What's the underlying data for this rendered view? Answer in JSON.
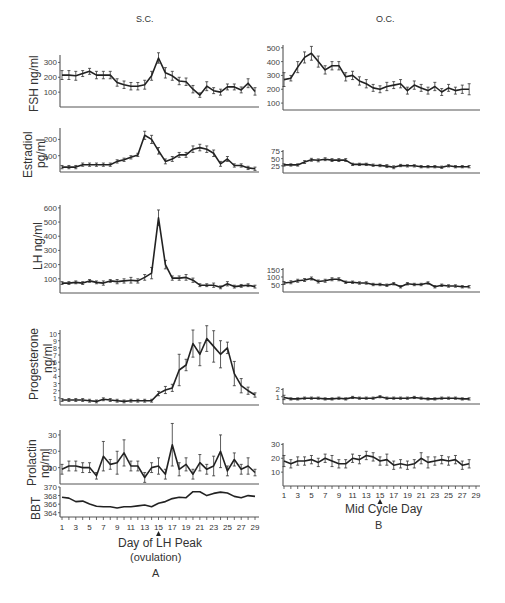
{
  "chart_data": [
    {
      "panel": "A",
      "title": "S.C.",
      "type": "line",
      "xlabel": "Day of LH Peak (ovulation)",
      "x": [
        1,
        2,
        3,
        4,
        5,
        6,
        7,
        8,
        9,
        10,
        11,
        12,
        13,
        14,
        15,
        16,
        17,
        18,
        19,
        20,
        21,
        22,
        23,
        24,
        25,
        26,
        27,
        28,
        29
      ],
      "xticks": [
        1,
        3,
        5,
        7,
        9,
        11,
        13,
        15,
        17,
        19,
        21,
        23,
        25,
        27,
        29
      ],
      "marker_day": 15,
      "series": [
        {
          "name": "FSH ng/ml",
          "ylabel": "FSH ng/ml",
          "yticks": [
            100,
            200,
            300
          ],
          "ylim": [
            0,
            350
          ],
          "values": [
            215,
            215,
            210,
            225,
            240,
            215,
            215,
            215,
            165,
            150,
            140,
            140,
            150,
            210,
            330,
            230,
            210,
            175,
            170,
            120,
            80,
            140,
            110,
            100,
            135,
            135,
            115,
            160,
            105
          ],
          "err": [
            30,
            30,
            30,
            20,
            20,
            25,
            25,
            25,
            25,
            25,
            25,
            25,
            30,
            30,
            35,
            35,
            30,
            25,
            25,
            25,
            15,
            30,
            20,
            20,
            20,
            20,
            20,
            30,
            25
          ]
        },
        {
          "name": "Estradiol pg/ml",
          "ylabel": "Estradiol pg/ml",
          "yticks": [
            100,
            200
          ],
          "ylim": [
            0,
            270
          ],
          "values": [
            30,
            30,
            30,
            45,
            45,
            45,
            45,
            45,
            65,
            75,
            90,
            105,
            225,
            200,
            130,
            65,
            80,
            105,
            105,
            140,
            150,
            140,
            115,
            50,
            80,
            40,
            40,
            25,
            20
          ],
          "err": [
            10,
            10,
            10,
            10,
            10,
            10,
            10,
            10,
            10,
            10,
            10,
            10,
            25,
            25,
            20,
            15,
            15,
            15,
            15,
            20,
            20,
            20,
            20,
            15,
            15,
            10,
            10,
            10,
            10
          ]
        },
        {
          "name": "LH ng/ml",
          "ylabel": "LH ng/ml",
          "yticks": [
            100,
            200,
            300,
            400,
            500,
            600
          ],
          "ylim": [
            0,
            620
          ],
          "values": [
            70,
            70,
            75,
            70,
            85,
            75,
            70,
            85,
            80,
            85,
            90,
            85,
            110,
            140,
            530,
            200,
            105,
            105,
            110,
            90,
            55,
            55,
            55,
            40,
            65,
            45,
            50,
            55,
            45
          ],
          "err": [
            10,
            10,
            10,
            10,
            10,
            10,
            15,
            10,
            15,
            15,
            20,
            15,
            20,
            40,
            55,
            30,
            15,
            15,
            20,
            15,
            10,
            10,
            15,
            10,
            15,
            10,
            10,
            10,
            10
          ]
        },
        {
          "name": "Progesterone ng/ml",
          "ylabel": "Progesterone ng/ml",
          "yticks": [
            1,
            2,
            3,
            4,
            5,
            6,
            7,
            8,
            9,
            10
          ],
          "ylim": [
            0,
            10.5
          ],
          "values": [
            0.7,
            0.7,
            0.7,
            0.7,
            0.6,
            0.5,
            0.8,
            0.7,
            0.6,
            0.5,
            0.6,
            0.6,
            0.6,
            0.6,
            1.6,
            2.1,
            2.4,
            4.9,
            5.6,
            8.6,
            7.1,
            9.3,
            8.2,
            7.1,
            8.0,
            4.4,
            2.7,
            2.0,
            1.4
          ],
          "err": [
            0.2,
            0.2,
            0.2,
            0.2,
            0.2,
            0.2,
            0.2,
            0.2,
            0.2,
            0.2,
            0.2,
            0.2,
            0.2,
            0.2,
            0.3,
            0.5,
            0.5,
            2.2,
            0.8,
            1.9,
            1.6,
            1.8,
            2.2,
            1.9,
            0.8,
            1.7,
            1.0,
            0.5,
            0.3
          ]
        },
        {
          "name": "Prolactin ng/ml",
          "ylabel": "Prolactin ng/ml",
          "yticks": [
            10,
            20,
            30
          ],
          "ylim": [
            0,
            33
          ],
          "values": [
            9,
            11,
            11,
            10,
            10,
            5,
            17,
            12,
            13,
            19,
            11,
            11,
            4,
            10,
            11,
            6,
            24,
            9,
            12,
            6,
            13,
            9,
            11,
            20,
            8,
            15,
            9,
            11,
            7
          ],
          "err": [
            3,
            3,
            3,
            3,
            3,
            2,
            9,
            3,
            7,
            8,
            3,
            3,
            3,
            3,
            5,
            3,
            13,
            4,
            4,
            3,
            5,
            3,
            6,
            10,
            3,
            4,
            3,
            5,
            2
          ]
        },
        {
          "name": "BBT",
          "ylabel": "BBT",
          "yticks": [
            364,
            366,
            368,
            370
          ],
          "ylim": [
            363,
            370
          ],
          "values": [
            367.6,
            367.4,
            366.6,
            366.7,
            366.0,
            365.5,
            365.4,
            365.4,
            365.1,
            365.4,
            365.4,
            365.6,
            365.8,
            365.4,
            366.2,
            366.6,
            367.3,
            367.6,
            367.5,
            368.9,
            368.9,
            368.0,
            368.5,
            368.8,
            368.6,
            367.8,
            367.5,
            368.0,
            367.8
          ],
          "err": [
            0,
            0,
            0,
            0,
            0,
            0,
            0,
            0,
            0,
            0,
            0,
            0,
            0,
            0,
            0,
            0,
            0,
            0,
            0,
            0,
            0,
            0,
            0,
            0,
            0,
            0,
            0,
            0,
            0
          ]
        }
      ]
    },
    {
      "panel": "B",
      "title": "O.C.",
      "type": "line",
      "xlabel": "Mid Cycle Day",
      "x": [
        1,
        2,
        3,
        4,
        5,
        6,
        7,
        8,
        9,
        10,
        11,
        12,
        13,
        14,
        15,
        16,
        17,
        18,
        19,
        20,
        21,
        22,
        23,
        24,
        25,
        26,
        27,
        28
      ],
      "xticks": [
        1,
        3,
        5,
        7,
        9,
        11,
        13,
        15,
        17,
        19,
        21,
        23,
        25,
        27,
        29
      ],
      "marker_day": 15,
      "series": [
        {
          "name": "FSH ng/ml",
          "yticks": [
            100,
            200,
            300,
            400,
            500
          ],
          "ylim": [
            50,
            520
          ],
          "values": [
            270,
            280,
            360,
            430,
            460,
            400,
            340,
            370,
            370,
            290,
            300,
            260,
            240,
            210,
            200,
            220,
            230,
            240,
            190,
            230,
            210,
            190,
            220,
            180,
            210,
            190,
            200,
            200
          ],
          "err": [
            50,
            20,
            40,
            40,
            50,
            40,
            30,
            30,
            30,
            30,
            30,
            30,
            30,
            25,
            25,
            30,
            25,
            30,
            25,
            30,
            25,
            25,
            30,
            25,
            25,
            25,
            30,
            40
          ]
        },
        {
          "name": "Estradiol pg/ml",
          "yticks": [
            25,
            50,
            75
          ],
          "ylim": [
            0,
            80
          ],
          "values": [
            28,
            28,
            28,
            38,
            46,
            44,
            48,
            45,
            45,
            45,
            30,
            30,
            30,
            27,
            26,
            24,
            20,
            26,
            25,
            25,
            22,
            22,
            22,
            20,
            25,
            22,
            22,
            22
          ],
          "err": [
            4,
            4,
            4,
            5,
            5,
            5,
            5,
            5,
            5,
            5,
            4,
            4,
            4,
            4,
            4,
            5,
            5,
            4,
            4,
            4,
            4,
            4,
            4,
            4,
            4,
            4,
            4,
            4
          ]
        },
        {
          "name": "LH ng/ml",
          "yticks": [
            50,
            100,
            150
          ],
          "ylim": [
            0,
            160
          ],
          "values": [
            60,
            65,
            75,
            80,
            90,
            70,
            75,
            85,
            85,
            65,
            65,
            60,
            60,
            50,
            50,
            45,
            55,
            35,
            55,
            50,
            50,
            60,
            35,
            45,
            40,
            40,
            35,
            35,
            30
          ],
          "err": [
            10,
            10,
            10,
            10,
            10,
            10,
            10,
            10,
            10,
            8,
            8,
            8,
            8,
            8,
            8,
            8,
            8,
            8,
            8,
            8,
            8,
            8,
            8,
            8,
            8,
            8,
            8,
            8
          ]
        },
        {
          "name": "Progesterone ng/ml",
          "yticks": [
            1,
            2
          ],
          "ylim": [
            0,
            2.2
          ],
          "values": [
            0.9,
            0.7,
            0.7,
            0.8,
            0.8,
            0.8,
            0.7,
            0.7,
            0.8,
            0.7,
            0.9,
            0.8,
            0.8,
            0.8,
            1.0,
            0.8,
            0.8,
            0.8,
            0.8,
            0.9,
            0.8,
            0.7,
            0.7,
            0.8,
            0.8,
            0.8,
            0.7,
            0.7
          ],
          "err": [
            0.3,
            0.15,
            0.15,
            0.15,
            0.15,
            0.15,
            0.15,
            0.15,
            0.15,
            0.15,
            0.15,
            0.15,
            0.15,
            0.15,
            0.15,
            0.15,
            0.15,
            0.15,
            0.15,
            0.15,
            0.15,
            0.15,
            0.15,
            0.15,
            0.15,
            0.15,
            0.15,
            0.15
          ]
        },
        {
          "name": "Prolactin ng/ml",
          "yticks": [
            10,
            20,
            30
          ],
          "ylim": [
            0,
            31
          ],
          "values": [
            18,
            16,
            18,
            18,
            19,
            17,
            20,
            18,
            16,
            16,
            20,
            19,
            22,
            21,
            18,
            19,
            15,
            16,
            15,
            16,
            20,
            17,
            18,
            19,
            18,
            19,
            15,
            16
          ],
          "err": [
            4,
            3,
            3,
            3,
            3,
            3,
            3,
            4,
            3,
            3,
            3,
            3,
            3,
            3,
            3,
            4,
            3,
            3,
            3,
            3,
            4,
            4,
            3,
            3,
            3,
            3,
            3,
            3
          ]
        }
      ]
    }
  ],
  "labels": {
    "title_a": "S.C.",
    "title_b": "O.C.",
    "fsh": "FSH ng/ml",
    "estradiol_1": "Estradiol",
    "estradiol_2": "pg/ml",
    "lh": "LH ng/ml",
    "progesterone_1": "Progesterone",
    "progesterone_2": "ng/ml",
    "prolactin_1": "Prolactin",
    "prolactin_2": "ng/ml",
    "bbt": "BBT",
    "xlabel_a_1": "Day of LH Peak",
    "xlabel_a_2": "(ovulation)",
    "xlabel_b": "Mid Cycle Day",
    "panel_a": "A",
    "panel_b": "B"
  }
}
